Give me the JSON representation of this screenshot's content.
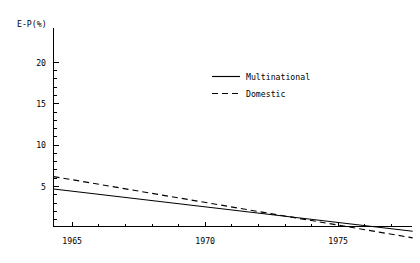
{
  "chart_data": {
    "type": "line",
    "title": "",
    "subtitle": "",
    "xlabel": "",
    "ylabel": "E-P(%)",
    "xlim": [
      1964.3,
      1977.8
    ],
    "ylim": [
      0,
      22.5
    ],
    "grid": false,
    "legend_position": "upper-center-right",
    "x_ticks_major": [
      1965,
      1970,
      1975
    ],
    "x_tick_labels": [
      "1965",
      "1970",
      "1975"
    ],
    "x_ticks_minor": [
      1966,
      1967,
      1968,
      1969,
      1971,
      1972,
      1973,
      1974,
      1976,
      1977
    ],
    "y_ticks_major": [
      5,
      10,
      15,
      20
    ],
    "y_tick_labels": [
      "5",
      "10",
      "15",
      "20"
    ],
    "series": [
      {
        "name": "Multinational",
        "style": "solid",
        "color": "#000000",
        "x": [
          1964.3,
          1977.8
        ],
        "values": [
          5.3,
          10.4
        ]
      },
      {
        "name": "Domestic",
        "style": "dashed",
        "color": "#000000",
        "x": [
          1964.3,
          1977.8
        ],
        "values": [
          3.8,
          11.2
        ]
      }
    ]
  },
  "axis": {
    "y_title": "E-P(%)",
    "y_tick_labels": [
      "20",
      "15",
      "10",
      "5"
    ],
    "x_tick_labels": [
      "1965",
      "1970",
      "1975"
    ]
  },
  "legend": {
    "entries": [
      {
        "label": "Multinational",
        "style": "solid"
      },
      {
        "label": "Domestic",
        "style": "dashed"
      }
    ]
  }
}
